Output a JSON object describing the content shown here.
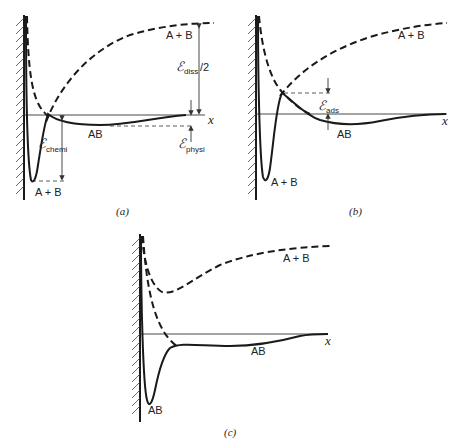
{
  "figure": {
    "panels": [
      {
        "id": "a",
        "caption": "(a)",
        "axis_label": "x",
        "labels": {
          "dashed_far": "A + B",
          "solid_shallow": "AB",
          "solid_deep": "A + B",
          "e_diss_symbol": "ℰ",
          "e_diss_sub": "diss",
          "e_diss_suffix": "/2",
          "e_chemi_symbol": "ℰ",
          "e_chemi_sub": "chemi",
          "e_physi_symbol": "ℰ",
          "e_physi_sub": "physi"
        }
      },
      {
        "id": "b",
        "caption": "(b)",
        "axis_label": "x",
        "labels": {
          "dashed_far": "A + B",
          "solid_shallow": "AB",
          "solid_deep": "A + B",
          "e_ads_symbol": "ℰ",
          "e_ads_sub": "ads"
        }
      },
      {
        "id": "c",
        "caption": "(c)",
        "axis_label": "x",
        "labels": {
          "dashed_far": "A + B",
          "solid_shallow": "AB",
          "solid_deep": "AB"
        }
      }
    ]
  }
}
